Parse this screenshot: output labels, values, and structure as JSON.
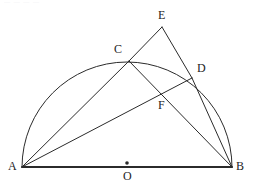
{
  "figure": {
    "background_color": "#ffffff",
    "stroke_color": "#2b2b2b",
    "label_color": "#1c1c1c",
    "top_edge_artifact": "— — — —"
  },
  "labels": {
    "a": "A",
    "b": "B",
    "c": "C",
    "d": "D",
    "e": "E",
    "f": "F",
    "o": "O"
  },
  "geometry": {
    "points": {
      "A": {
        "x": 22,
        "y": 167,
        "label_x": 8,
        "label_y": 160
      },
      "B": {
        "x": 232,
        "y": 167,
        "label_x": 236,
        "label_y": 160
      },
      "C": {
        "x": 129,
        "y": 61,
        "label_x": 114,
        "label_y": 43
      },
      "D": {
        "x": 192,
        "y": 78,
        "label_x": 197,
        "label_y": 62
      },
      "E": {
        "x": 162,
        "y": 27,
        "label_x": 158,
        "label_y": 9
      },
      "F": {
        "x": 156,
        "y": 96,
        "label_x": 158,
        "label_y": 99
      },
      "O": {
        "x": 127,
        "y": 167,
        "label_x": 123,
        "label_y": 170
      }
    },
    "circle": {
      "center_x": 127,
      "center_y": 167,
      "radius": 105,
      "arc_description": "semicircle above diameter AB"
    },
    "segments": [
      {
        "name": "AB",
        "from": "A",
        "to": "B",
        "width": 2.0
      },
      {
        "name": "AC",
        "from": "A",
        "to": "C",
        "width": 1.0
      },
      {
        "name": "AD",
        "from": "A",
        "to": "D",
        "width": 1.0
      },
      {
        "name": "CB",
        "from": "C",
        "to": "B",
        "width": 1.0
      },
      {
        "name": "DB",
        "from": "D",
        "to": "B",
        "width": 1.0
      },
      {
        "name": "CE",
        "from": "C",
        "to": "E",
        "width": 1.0
      },
      {
        "name": "ED",
        "from": "E",
        "to": "D",
        "width": 1.0
      }
    ],
    "marked_points": [
      {
        "name": "O",
        "x": 127,
        "y": 163,
        "radius": 1.8
      }
    ]
  }
}
